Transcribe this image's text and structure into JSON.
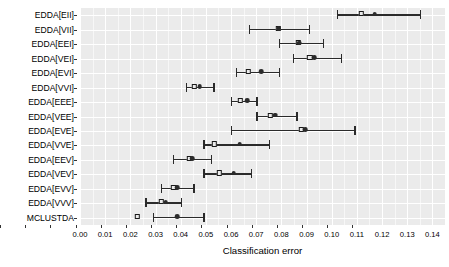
{
  "chart_data": {
    "type": "scatter",
    "title": "",
    "subtitle": "",
    "xlabel": "Classification error",
    "ylabel": "",
    "xlim": [
      0.0,
      0.145
    ],
    "xticks": [
      0.0,
      0.01,
      0.02,
      0.03,
      0.04,
      0.05,
      0.06,
      0.07,
      0.08,
      0.09,
      0.1,
      0.11,
      0.12,
      0.13,
      0.14
    ],
    "xticklabels": [
      "0.00",
      "0.01",
      "0.02",
      "0.03",
      "0.04",
      "0.05",
      "0.06",
      "0.07",
      "0.08",
      "0.09",
      "0.10",
      "0.11",
      "0.12",
      "0.13",
      "0.14"
    ],
    "categories": [
      "EDDA[EII]",
      "EDDA[VII]",
      "EDDA[EEI]",
      "EDDA[VEI]",
      "EDDA[EVI]",
      "EDDA[VVI]",
      "EDDA[EEE]",
      "EDDA[VEE]",
      "EDDA[EVE]",
      "EDDA[VVE]",
      "EDDA[EEV]",
      "EDDA[VEV]",
      "EDDA[EVV]",
      "EDDA[VVV]",
      "MCLUSTDA"
    ],
    "grid": true,
    "legend": null,
    "marker_semantics": {
      "open_square": "mean",
      "filled_circle": "median",
      "whisker": "error bar / range"
    },
    "series": [
      {
        "name": "mean",
        "marker": "open-square",
        "values": [
          0.112,
          0.079,
          0.087,
          0.0915,
          0.067,
          0.0455,
          0.064,
          0.076,
          0.088,
          0.0535,
          0.0435,
          0.0555,
          0.0375,
          0.0325,
          0.023
        ]
      },
      {
        "name": "median",
        "marker": "filled-circle",
        "values": [
          0.117,
          0.079,
          0.087,
          0.093,
          0.072,
          0.0475,
          0.0665,
          0.0775,
          0.0895,
          0.0635,
          0.0445,
          0.061,
          0.0385,
          0.034,
          0.0385
        ]
      }
    ],
    "error_bars": {
      "low": [
        0.102,
        0.067,
        0.079,
        0.0845,
        0.062,
        0.042,
        0.06,
        0.07,
        0.06,
        0.049,
        0.037,
        0.049,
        0.032,
        0.026,
        0.029
      ],
      "high": [
        0.135,
        0.091,
        0.0965,
        0.1035,
        0.079,
        0.053,
        0.07,
        0.086,
        0.109,
        0.075,
        0.052,
        0.068,
        0.045,
        0.04,
        0.049
      ]
    },
    "colors": {
      "panel": "#ebebeb",
      "grid_major": "#ffffff",
      "grid_minor": "#f7f7f7",
      "mark": "#2b2b2b",
      "square_fill": "#ebebeb",
      "text": "#000000"
    }
  }
}
